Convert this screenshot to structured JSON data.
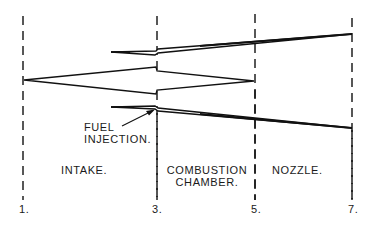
{
  "diagram": {
    "type": "ramjet-section-schematic",
    "stroke_color": "#111111",
    "background": "#ffffff",
    "stations": [
      {
        "label": "1.",
        "x": 23
      },
      {
        "label": "3.",
        "x": 157
      },
      {
        "label": "5.",
        "x": 255
      },
      {
        "label": "7.",
        "x": 352
      }
    ],
    "sections": [
      {
        "label": "INTAKE."
      },
      {
        "label_line1": "COMBUSTION",
        "label_line2": "CHAMBER."
      },
      {
        "label": "NOZZLE."
      }
    ],
    "annotations": {
      "fuel_injection_line1": "FUEL",
      "fuel_injection_line2": "INJECTION."
    }
  }
}
